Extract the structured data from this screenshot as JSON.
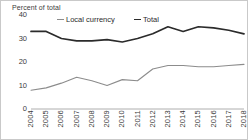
{
  "axis_title": "Percent of total",
  "legend": {
    "position": "top",
    "entries": [
      {
        "label": "Local currency",
        "color": "#8c8c8c",
        "width": 1.1
      },
      {
        "label": "Total",
        "color": "#2b2b2b",
        "width": 1.7
      }
    ]
  },
  "y_axis": {
    "ticks": [
      "0",
      "10",
      "20",
      "30",
      "40"
    ],
    "min": 0,
    "max": 40
  },
  "x_axis": {
    "ticks": [
      "2004",
      "2005",
      "2006",
      "2007",
      "2008",
      "2009",
      "2010",
      "2011",
      "2012",
      "2013",
      "2014",
      "2015",
      "2016",
      "2017",
      "2018"
    ]
  },
  "chart_data": {
    "type": "line",
    "title": "",
    "xlabel": "",
    "ylabel": "Percent of total",
    "ylim": [
      0,
      40
    ],
    "grid": false,
    "legend_position": "top",
    "x": [
      2004,
      2005,
      2006,
      2007,
      2008,
      2009,
      2010,
      2011,
      2012,
      2013,
      2014,
      2015,
      2016,
      2017,
      2018
    ],
    "categories": [
      "2004",
      "2005",
      "2006",
      "2007",
      "2008",
      "2009",
      "2010",
      "2011",
      "2012",
      "2013",
      "2014",
      "2015",
      "2016",
      "2017",
      "2018"
    ],
    "series": [
      {
        "name": "Total",
        "color": "#2b2b2b",
        "values": [
          33,
          33,
          30,
          29,
          29,
          29.5,
          28.5,
          30,
          32,
          35,
          33,
          35,
          34.5,
          33.5,
          32
        ]
      },
      {
        "name": "Local currency",
        "color": "#8c8c8c",
        "values": [
          8,
          9,
          11,
          13.5,
          12,
          10,
          12.5,
          12,
          17,
          18.5,
          18.5,
          18,
          18,
          18.5,
          19
        ]
      }
    ]
  }
}
